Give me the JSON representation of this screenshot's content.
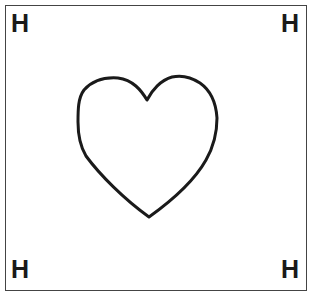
{
  "card": {
    "corners": {
      "top_left": "H",
      "top_right": "H",
      "bottom_left": "H",
      "bottom_right": "H"
    },
    "center_icon": "heart-outline-icon",
    "colors": {
      "stroke": "#1a1a1a",
      "border": "#444444",
      "background": "#ffffff"
    }
  }
}
